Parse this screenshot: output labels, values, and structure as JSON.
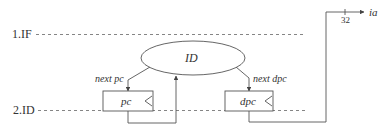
{
  "diagram": {
    "stages": [
      {
        "label": "1.IF"
      },
      {
        "label": "2.ID"
      }
    ],
    "ellipse": {
      "label": "ID"
    },
    "registers": [
      {
        "label": "pc",
        "input_label": "next pc"
      },
      {
        "label": "dpc",
        "input_label": "next dpc"
      }
    ],
    "output": {
      "label": "ia",
      "bus_width": "32"
    },
    "colors": {
      "stroke": "#555555",
      "text": "#333333",
      "background": "#ffffff"
    }
  }
}
